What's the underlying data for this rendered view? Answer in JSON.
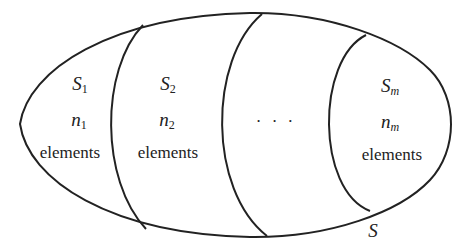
{
  "diagram": {
    "type": "partition-of-set",
    "stroke_color": "#222222",
    "background": "#ffffff",
    "universe_label": "S",
    "ellipsis": "· · ·",
    "regions": [
      {
        "set_symbol": "S",
        "set_subscript": "1",
        "count_symbol": "n",
        "count_subscript": "1",
        "caption": "elements"
      },
      {
        "set_symbol": "S",
        "set_subscript": "2",
        "count_symbol": "n",
        "count_subscript": "2",
        "caption": "elements"
      },
      {
        "set_symbol": "S",
        "set_subscript": "m",
        "count_symbol": "n",
        "count_subscript": "m",
        "caption": "elements"
      }
    ]
  }
}
